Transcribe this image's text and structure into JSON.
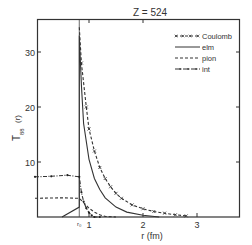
{
  "chart_data": {
    "type": "line",
    "title": "Z = 524",
    "xlabel": "r (fm)",
    "ylabel": "T₈₈ (r)",
    "xlim": [
      0,
      3.8
    ],
    "ylim": [
      0,
      36
    ],
    "x_ticks": [
      1,
      2,
      3
    ],
    "x_tick_labels": [
      "1",
      "2",
      "3"
    ],
    "x_special_tick": {
      "label": "r₀",
      "value": 0.82
    },
    "y_ticks": [
      10,
      20,
      30
    ],
    "y_tick_labels": [
      "10",
      "20",
      "30"
    ],
    "grid": false,
    "legend_position": "upper right",
    "series": [
      {
        "name": "Coulomb",
        "style": "dash-x",
        "x": [
          0.82,
          0.86,
          0.95,
          1.0,
          1.1,
          1.2,
          1.3,
          1.4,
          1.5,
          1.6,
          1.8,
          2.0,
          2.2,
          2.4,
          2.6,
          2.8
        ],
        "y": [
          34.5,
          28.0,
          20.0,
          16.0,
          12.0,
          9.0,
          7.0,
          5.5,
          4.3,
          3.4,
          2.2,
          1.5,
          1.0,
          0.7,
          0.4,
          0.2
        ]
      },
      {
        "name": "elm",
        "style": "solid",
        "x": [
          0.5,
          0.82,
          0.82,
          0.86,
          0.9,
          1.0,
          1.1,
          1.2,
          1.3,
          1.5,
          1.7,
          2.0,
          2.3
        ],
        "y": [
          0.0,
          1.8,
          33.0,
          24.0,
          17.0,
          10.5,
          7.0,
          5.0,
          3.5,
          1.8,
          0.9,
          0.3,
          0.0
        ]
      },
      {
        "name": "pion",
        "style": "dashed",
        "x": [
          0.0,
          0.5,
          0.82,
          0.9,
          1.0,
          1.1,
          1.2,
          1.3,
          1.5
        ],
        "y": [
          3.4,
          3.5,
          3.4,
          2.6,
          1.6,
          0.9,
          0.4,
          0.1,
          0.0
        ]
      },
      {
        "name": "int",
        "style": "dash-dot",
        "x": [
          0.0,
          0.3,
          0.6,
          0.82,
          0.86,
          0.9,
          0.95,
          1.0,
          1.05,
          1.1,
          1.2
        ],
        "y": [
          7.3,
          7.4,
          7.6,
          7.3,
          4.5,
          2.8,
          1.6,
          0.8,
          0.3,
          0.0,
          0.0
        ]
      }
    ]
  },
  "legend": {
    "items": [
      {
        "label": "Coulomb",
        "style": "dash-x"
      },
      {
        "label": "elm",
        "style": "solid"
      },
      {
        "label": "pion",
        "style": "dashed"
      },
      {
        "label": "int",
        "style": "dash-dot"
      }
    ]
  },
  "axes": {
    "title": "Z = 524",
    "xlabel": "r (fm)",
    "ylabel_main": "T",
    "ylabel_sub": "88",
    "ylabel_arg": "(r)",
    "r0_label": "r₀"
  }
}
